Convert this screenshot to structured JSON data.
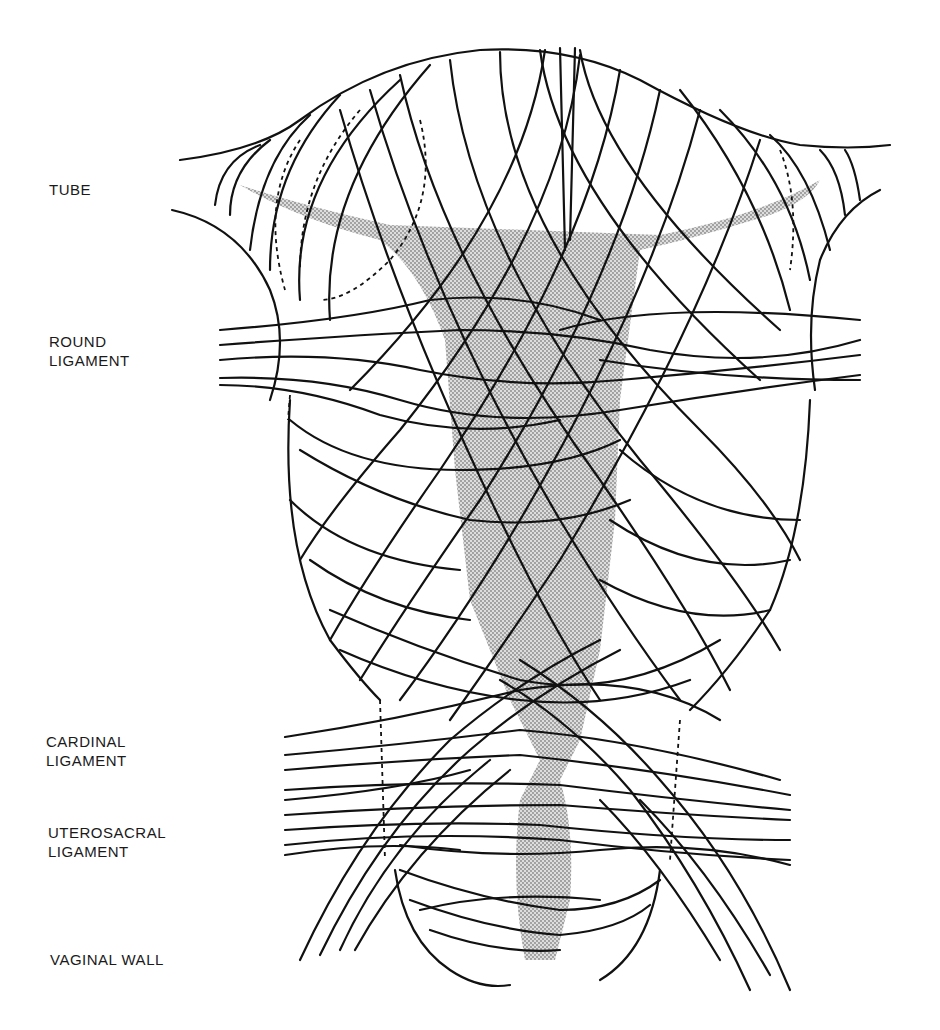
{
  "figure": {
    "colors": {
      "line": "#111111",
      "shading": "#b8b8b8",
      "background": "#ffffff"
    },
    "labels": [
      {
        "id": "tube",
        "text": "TUBE"
      },
      {
        "id": "round-ligament",
        "text": "ROUND\nLIGAMENT"
      },
      {
        "id": "cardinal-ligament",
        "text": "CARDINAL\nLIGAMENT"
      },
      {
        "id": "uterosacral-ligament",
        "text": "UTEROSACRAL\nLIGAMENT"
      },
      {
        "id": "vaginal-wall",
        "text": "VAGINAL WALL"
      }
    ]
  }
}
